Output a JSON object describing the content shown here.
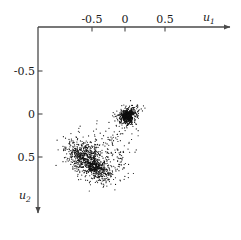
{
  "figure": {
    "background_color": "#ffffff",
    "axis_color": "#4a4a4a",
    "point_color": "#101010"
  },
  "axes": {
    "x_axis_name": "u",
    "x_axis_subscript": "1",
    "y_axis_name": "u",
    "y_axis_subscript": "2",
    "x_ticks": [
      "-0.5",
      "0",
      "0.5"
    ],
    "y_ticks": [
      "-0.5",
      "0",
      "0.5"
    ]
  },
  "chart_data": {
    "type": "scatter",
    "title": "",
    "xlabel": "u1",
    "ylabel": "u2",
    "xlim": [
      -0.95,
      1.35
    ],
    "ylim": [
      -0.82,
      1.22
    ],
    "y_axis_inverted": true,
    "grid": false,
    "legend": null,
    "x_tick_values": [
      -0.5,
      0,
      0.5
    ],
    "y_tick_values": [
      -0.5,
      0,
      0.5
    ],
    "x_tick_labels": [
      "-0.5",
      "0",
      "0.5"
    ],
    "y_tick_labels": [
      "-0.5",
      "0",
      "0.5"
    ],
    "marker": {
      "shape": "dot",
      "size_px": 1.2,
      "color": "#101010"
    },
    "n_points_approx": 1600,
    "clusters": [
      {
        "name": "compact-cluster-upper-right",
        "center": [
          0.035,
          0.025
        ],
        "spread": [
          0.055,
          0.05
        ],
        "n": 420,
        "shape": "round-dense"
      },
      {
        "name": "compact-cluster-core",
        "center": [
          0.03,
          0.02
        ],
        "spread": [
          0.028,
          0.026
        ],
        "n": 260,
        "shape": "round-dense"
      },
      {
        "name": "upper-cluster-tail",
        "center": [
          0.105,
          -0.03
        ],
        "spread": [
          0.075,
          0.028
        ],
        "n": 45,
        "shape": "linear-up-right"
      },
      {
        "name": "diffuse-cluster-lower-left",
        "center": [
          -0.45,
          0.545
        ],
        "spread": [
          0.155,
          0.105
        ],
        "n": 520,
        "shape": "elongated-diagonal"
      },
      {
        "name": "dense-core-lower-left",
        "center": [
          -0.36,
          0.63
        ],
        "spread": [
          0.095,
          0.048
        ],
        "n": 330,
        "shape": "elongated-diagonal"
      },
      {
        "name": "lower-left-upper-arm",
        "center": [
          -0.56,
          0.44
        ],
        "spread": [
          0.085,
          0.07
        ],
        "n": 150,
        "shape": "diffuse"
      },
      {
        "name": "bridge-trail",
        "center": [
          -0.135,
          0.255
        ],
        "spread": [
          0.075,
          0.12
        ],
        "n": 70,
        "shape": "diagonal-sparse"
      },
      {
        "name": "right-scatter-outliers",
        "center": [
          -0.08,
          0.58
        ],
        "spread": [
          0.085,
          0.09
        ],
        "n": 60,
        "shape": "sparse"
      }
    ]
  }
}
